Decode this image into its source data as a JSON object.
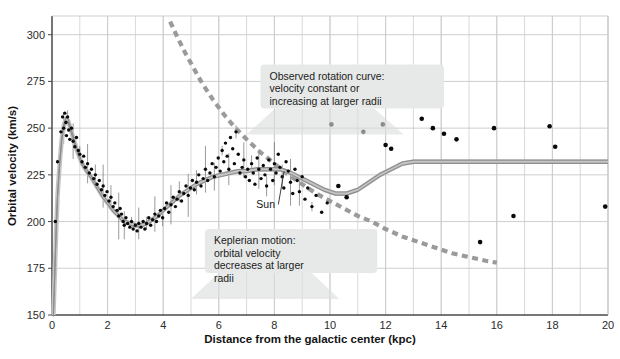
{
  "chart_data": {
    "type": "scatter",
    "title": "",
    "xlabel": "Distance from the galactic center (kpc)",
    "ylabel": "Orbital velocity (km/s)",
    "xlim": [
      0,
      20
    ],
    "ylim": [
      150,
      310
    ],
    "xticks": [
      0,
      2,
      4,
      6,
      8,
      10,
      12,
      14,
      16,
      18,
      20
    ],
    "xtick_labels": [
      "0",
      "2",
      "4",
      "6",
      "8",
      "10",
      "12",
      "14",
      "16",
      "18",
      "20"
    ],
    "x_minor_step": 1,
    "yticks": [
      150,
      175,
      200,
      225,
      250,
      275,
      300
    ],
    "ytick_labels": [
      "150",
      "175",
      "200",
      "225",
      "250",
      "275",
      "300"
    ],
    "grid": true,
    "legend": "none",
    "series": [
      {
        "name": "Observed model rotation curve",
        "type": "line",
        "style": "solid-grey-band",
        "color": "#8d8d8d",
        "points": [
          [
            0.05,
            150
          ],
          [
            0.1,
            172
          ],
          [
            0.15,
            196
          ],
          [
            0.2,
            214
          ],
          [
            0.28,
            232
          ],
          [
            0.35,
            244
          ],
          [
            0.42,
            251
          ],
          [
            0.5,
            255
          ],
          [
            0.58,
            254
          ],
          [
            0.66,
            250
          ],
          [
            0.78,
            244
          ],
          [
            0.9,
            238
          ],
          [
            1.05,
            232
          ],
          [
            1.2,
            228
          ],
          [
            1.4,
            224
          ],
          [
            1.6,
            219
          ],
          [
            1.8,
            214
          ],
          [
            2.0,
            210
          ],
          [
            2.2,
            206
          ],
          [
            2.4,
            203
          ],
          [
            2.6,
            200
          ],
          [
            2.8,
            199
          ],
          [
            3.0,
            198
          ],
          [
            3.2,
            198
          ],
          [
            3.4,
            199
          ],
          [
            3.6,
            201
          ],
          [
            3.8,
            203
          ],
          [
            4.0,
            206
          ],
          [
            4.3,
            210
          ],
          [
            4.6,
            214
          ],
          [
            4.9,
            217
          ],
          [
            5.2,
            220
          ],
          [
            5.5,
            222
          ],
          [
            5.8,
            224
          ],
          [
            6.1,
            225
          ],
          [
            6.4,
            226
          ],
          [
            6.7,
            227
          ],
          [
            7.0,
            227
          ],
          [
            7.4,
            228
          ],
          [
            7.8,
            228
          ],
          [
            8.2,
            228
          ],
          [
            8.6,
            226
          ],
          [
            9.0,
            223
          ],
          [
            9.4,
            220
          ],
          [
            9.8,
            217
          ],
          [
            10.2,
            215
          ],
          [
            10.6,
            215
          ],
          [
            11.0,
            217
          ],
          [
            11.4,
            221
          ],
          [
            11.8,
            225
          ],
          [
            12.2,
            228
          ],
          [
            12.6,
            231
          ],
          [
            13.0,
            232
          ],
          [
            13.5,
            232
          ],
          [
            14.0,
            232
          ],
          [
            15.0,
            232
          ],
          [
            16.0,
            232
          ],
          [
            17.0,
            232
          ],
          [
            18.0,
            232
          ],
          [
            19.0,
            232
          ],
          [
            20.0,
            232
          ]
        ]
      },
      {
        "name": "Keplerian motion prediction",
        "type": "line",
        "style": "dashed",
        "color": "#9a9a9a",
        "points": [
          [
            4.25,
            307
          ],
          [
            4.5,
            299
          ],
          [
            4.8,
            290
          ],
          [
            5.1,
            282
          ],
          [
            5.4,
            274
          ],
          [
            5.8,
            265
          ],
          [
            6.2,
            257
          ],
          [
            6.6,
            250
          ],
          [
            7.0,
            244
          ],
          [
            7.5,
            237
          ],
          [
            8.0,
            231
          ],
          [
            8.5,
            225
          ],
          [
            9.0,
            220
          ],
          [
            9.5,
            215
          ],
          [
            10.0,
            211
          ],
          [
            10.5,
            207
          ],
          [
            11.0,
            203
          ],
          [
            11.5,
            200
          ],
          [
            12.0,
            196
          ],
          [
            12.6,
            192
          ],
          [
            13.2,
            189
          ],
          [
            13.8,
            186
          ],
          [
            14.4,
            183
          ],
          [
            15.0,
            181
          ],
          [
            15.6,
            179
          ],
          [
            16.0,
            178
          ]
        ]
      },
      {
        "name": "Observed velocity measurements (inner disk)",
        "type": "scatter",
        "marker": "dot",
        "color": "#0a0a0a",
        "points": [
          [
            0.12,
            200
          ],
          [
            0.2,
            232
          ],
          [
            0.32,
            248
          ],
          [
            0.38,
            256
          ],
          [
            0.42,
            250
          ],
          [
            0.46,
            258
          ],
          [
            0.5,
            253
          ],
          [
            0.52,
            246
          ],
          [
            0.56,
            256
          ],
          [
            0.6,
            249
          ],
          [
            0.64,
            244
          ],
          [
            0.7,
            250
          ],
          [
            0.76,
            243
          ],
          [
            0.82,
            240
          ],
          [
            0.88,
            245
          ],
          [
            0.95,
            238
          ],
          [
            1.0,
            236
          ],
          [
            1.08,
            232
          ],
          [
            1.14,
            235
          ],
          [
            1.2,
            229
          ],
          [
            1.28,
            231
          ],
          [
            1.34,
            226
          ],
          [
            1.42,
            228
          ],
          [
            1.5,
            223
          ],
          [
            1.56,
            225
          ],
          [
            1.62,
            220
          ],
          [
            1.7,
            222
          ],
          [
            1.78,
            217
          ],
          [
            1.84,
            219
          ],
          [
            1.9,
            214
          ],
          [
            1.98,
            216
          ],
          [
            2.05,
            211
          ],
          [
            2.12,
            213
          ],
          [
            2.2,
            208
          ],
          [
            2.26,
            210
          ],
          [
            2.34,
            206
          ],
          [
            2.4,
            203
          ],
          [
            2.45,
            207
          ],
          [
            2.5,
            204
          ],
          [
            2.56,
            200
          ],
          [
            2.6,
            198
          ],
          [
            2.66,
            202
          ],
          [
            2.72,
            199
          ],
          [
            2.8,
            197
          ],
          [
            2.86,
            200
          ],
          [
            2.92,
            196
          ],
          [
            3.0,
            198
          ],
          [
            3.06,
            195
          ],
          [
            3.12,
            199
          ],
          [
            3.2,
            197
          ],
          [
            3.28,
            200
          ],
          [
            3.34,
            196
          ],
          [
            3.4,
            199
          ],
          [
            3.48,
            202
          ],
          [
            3.55,
            198
          ],
          [
            3.62,
            201
          ],
          [
            3.7,
            204
          ],
          [
            3.76,
            200
          ],
          [
            3.84,
            203
          ],
          [
            3.9,
            206
          ],
          [
            3.98,
            202
          ],
          [
            4.05,
            207
          ],
          [
            4.12,
            210
          ],
          [
            4.2,
            205
          ],
          [
            4.28,
            209
          ],
          [
            4.36,
            213
          ],
          [
            4.44,
            208
          ],
          [
            4.5,
            212
          ],
          [
            4.58,
            216
          ],
          [
            4.66,
            211
          ],
          [
            4.74,
            215
          ],
          [
            4.82,
            219
          ],
          [
            4.9,
            214
          ],
          [
            4.98,
            218
          ],
          [
            5.05,
            222
          ],
          [
            5.12,
            217
          ],
          [
            5.2,
            221
          ],
          [
            5.28,
            225
          ],
          [
            5.36,
            219
          ],
          [
            5.44,
            223
          ],
          [
            5.52,
            228
          ],
          [
            5.6,
            222
          ],
          [
            5.68,
            226
          ],
          [
            5.76,
            231
          ],
          [
            5.84,
            224
          ],
          [
            5.9,
            229
          ],
          [
            5.98,
            234
          ],
          [
            6.05,
            227
          ],
          [
            6.12,
            238
          ],
          [
            6.18,
            232
          ],
          [
            6.24,
            242
          ],
          [
            6.3,
            235
          ],
          [
            6.36,
            228
          ],
          [
            6.42,
            245
          ],
          [
            6.5,
            239
          ],
          [
            6.56,
            231
          ],
          [
            6.62,
            248
          ],
          [
            6.7,
            236
          ],
          [
            6.76,
            226
          ],
          [
            6.84,
            229
          ],
          [
            6.9,
            233
          ],
          [
            6.96,
            224
          ],
          [
            7.04,
            228
          ],
          [
            7.1,
            222
          ],
          [
            7.18,
            231
          ],
          [
            7.24,
            226
          ],
          [
            7.3,
            220
          ],
          [
            7.38,
            234
          ],
          [
            7.44,
            228
          ],
          [
            7.52,
            223
          ],
          [
            7.6,
            230
          ],
          [
            7.66,
            225
          ],
          [
            7.72,
            219
          ],
          [
            7.8,
            233
          ],
          [
            7.86,
            228
          ],
          [
            7.94,
            222
          ],
          [
            8.0,
            231
          ],
          [
            8.06,
            226
          ],
          [
            8.14,
            236
          ],
          [
            8.2,
            229
          ],
          [
            8.28,
            224
          ],
          [
            8.34,
            218
          ],
          [
            8.42,
            232
          ],
          [
            8.5,
            227
          ],
          [
            8.58,
            221
          ],
          [
            8.66,
            215
          ],
          [
            8.74,
            228
          ],
          [
            8.82,
            222
          ],
          [
            8.9,
            216
          ],
          [
            9.0,
            224
          ],
          [
            9.1,
            212
          ],
          [
            9.2,
            218
          ],
          [
            9.35,
            208
          ],
          [
            9.5,
            214
          ],
          [
            9.7,
            205
          ],
          [
            9.9,
            210
          ]
        ]
      },
      {
        "name": "Observed velocity measurements (outer disk)",
        "type": "scatter",
        "marker": "dot",
        "color": "#0a0a0a",
        "points": [
          [
            10.05,
            252
          ],
          [
            10.3,
            219
          ],
          [
            10.6,
            213
          ],
          [
            11.2,
            248
          ],
          [
            11.9,
            252
          ],
          [
            12.0,
            241
          ],
          [
            12.2,
            239
          ],
          [
            12.45,
            268
          ],
          [
            12.7,
            268
          ],
          [
            13.3,
            255
          ],
          [
            13.7,
            250
          ],
          [
            14.1,
            247
          ],
          [
            14.55,
            244
          ],
          [
            15.4,
            189
          ],
          [
            15.9,
            250
          ],
          [
            16.6,
            203
          ],
          [
            17.9,
            251
          ],
          [
            18.1,
            240
          ],
          [
            19.9,
            208
          ]
        ]
      }
    ],
    "annotations": [
      {
        "name": "observed-rotation-curve-callout",
        "lines": [
          "Observed rotation curve:",
          "velocity constant or",
          "increasing at larger radii"
        ],
        "box_x": 7.5,
        "box_y": 284,
        "box_w": 6.6,
        "box_h": 44
      },
      {
        "name": "keplerian-motion-callout",
        "lines": [
          "Keplerian motion:",
          "orbital velocity",
          "decreases at larger",
          "radii"
        ],
        "box_x": 5.5,
        "box_y": 196,
        "box_w": 6.2,
        "box_h": 44
      },
      {
        "name": "sun-marker-label",
        "lines": [
          "Sun"
        ],
        "label_x": 7.35,
        "label_y": 207,
        "leader_to_x": 8.35,
        "leader_to_y": 227
      }
    ]
  },
  "colors": {
    "background": "#ffffff",
    "grid": "#c9c9c9",
    "axis": "#4a4a4a",
    "data_point": "#0a0a0a",
    "model_curve": "#8d8d8d",
    "keplerian_curve": "#9a9a9a",
    "callout_fill": "#e7e9e8",
    "text": "#141414"
  }
}
